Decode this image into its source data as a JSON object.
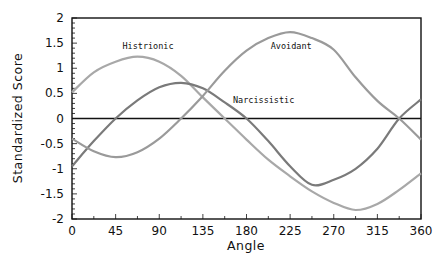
{
  "chart_data": {
    "type": "line",
    "title": "",
    "xlabel": "Angle",
    "ylabel": "Standardized Score",
    "xlim": [
      0,
      360
    ],
    "ylim": [
      -2,
      2
    ],
    "x_ticks": [
      0,
      45,
      90,
      135,
      180,
      225,
      270,
      315,
      360
    ],
    "x_tick_labels": [
      "0",
      "45",
      "90",
      "135",
      "180",
      "225",
      "270",
      "315",
      "360"
    ],
    "y_ticks": [
      2,
      1.5,
      1,
      0.5,
      0,
      -0.5,
      -1,
      -1.5,
      -2
    ],
    "y_tick_labels": [
      "2",
      "1.5",
      "1",
      "0.5",
      "0",
      "-0.5",
      "-1",
      "-1.5",
      "-2"
    ],
    "grid": false,
    "reference_line": {
      "y": 0
    },
    "legend": "inline labels",
    "x": [
      0,
      22.5,
      45,
      67.5,
      90,
      112.5,
      135,
      157.5,
      180,
      202.5,
      225,
      247.5,
      270,
      292.5,
      315,
      337.5,
      360
    ],
    "series": [
      {
        "name": "Histrionic",
        "color": "#a8a8a8",
        "label_pos": {
          "angle": 52,
          "value": 1.45
        },
        "values": [
          0.52,
          0.92,
          1.13,
          1.23,
          1.13,
          0.85,
          0.42,
          0.0,
          -0.42,
          -0.82,
          -1.15,
          -1.45,
          -1.68,
          -1.82,
          -1.7,
          -1.42,
          -1.09
        ]
      },
      {
        "name": "Narcissistic",
        "color": "#7a7a7a",
        "label_pos": {
          "angle": 166,
          "value": 0.37
        },
        "values": [
          -0.95,
          -0.45,
          0.0,
          0.36,
          0.62,
          0.71,
          0.6,
          0.32,
          0.0,
          -0.45,
          -0.95,
          -1.32,
          -1.22,
          -1.0,
          -0.6,
          0.0,
          0.38
        ]
      },
      {
        "name": "Avoidant",
        "color": "#9a9a9a",
        "label_pos": {
          "angle": 205,
          "value": 1.45
        },
        "values": [
          -0.4,
          -0.65,
          -0.77,
          -0.67,
          -0.4,
          0.0,
          0.45,
          0.95,
          1.35,
          1.6,
          1.72,
          1.6,
          1.37,
          0.82,
          0.35,
          0.0,
          -0.42
        ]
      }
    ]
  }
}
